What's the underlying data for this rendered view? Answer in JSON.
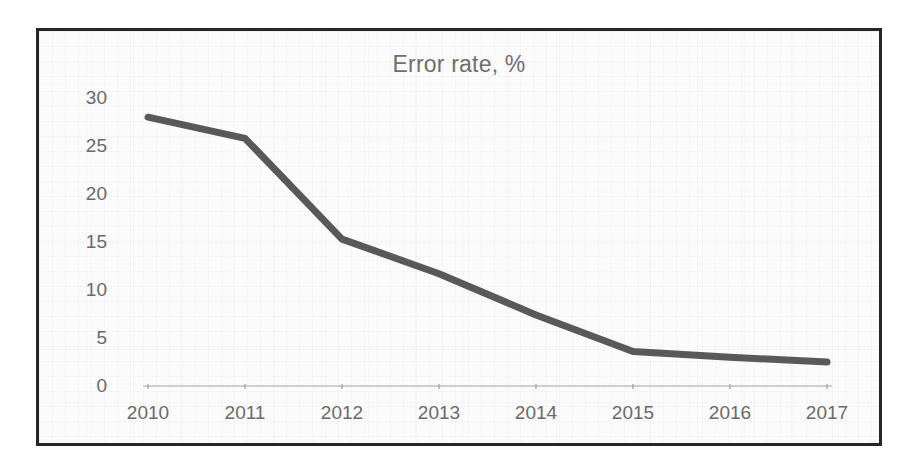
{
  "figure": {
    "border_color": "#262626",
    "background_color": "#fbfbfb"
  },
  "chart_data": {
    "type": "line",
    "title": "Error rate, %",
    "xlabel": "",
    "ylabel": "",
    "categories": [
      "2010",
      "2011",
      "2012",
      "2013",
      "2014",
      "2015",
      "2016",
      "2017"
    ],
    "values": [
      28.0,
      25.8,
      15.3,
      11.7,
      7.4,
      3.6,
      3.0,
      2.5
    ],
    "series": [
      {
        "name": "Error rate, %",
        "color": "#595959",
        "values": [
          28.0,
          25.8,
          15.3,
          11.7,
          7.4,
          3.6,
          3.0,
          2.5
        ]
      }
    ],
    "ylim": [
      0,
      30
    ],
    "xlim_categories": [
      "2010",
      "2017"
    ],
    "y_ticks": [
      "0",
      "5",
      "10",
      "15",
      "20",
      "25",
      "30"
    ],
    "y_tick_values": [
      0,
      5,
      10,
      15,
      20,
      25,
      30
    ],
    "x_ticks": [
      "2010",
      "2011",
      "2012",
      "2013",
      "2014",
      "2015",
      "2016",
      "2017"
    ],
    "grid": false,
    "legend": false,
    "legend_position": "none",
    "line_color": "#595959",
    "line_width": 7,
    "axis_line_color": "#bfbfbf",
    "tick_label_color": "#6a6a6a",
    "title_color": "#6e6e6e"
  }
}
